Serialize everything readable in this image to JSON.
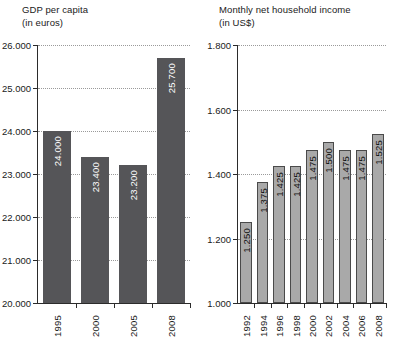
{
  "chart_data": [
    {
      "type": "bar",
      "id": "gdp-per-capita",
      "title": "GDP per capita",
      "subtitle": "(in euros)",
      "xlabel": "",
      "ylabel": "",
      "grid": true,
      "legend": "none",
      "categories": [
        "1995",
        "2000",
        "2005",
        "2008"
      ],
      "values": [
        24000,
        23400,
        23200,
        25700
      ],
      "value_labels": [
        "24.000",
        "23.400",
        "23.200",
        "25.700"
      ],
      "ylim": [
        20000,
        26000
      ],
      "yticks": [
        20000,
        21000,
        22000,
        23000,
        24000,
        25000,
        26000
      ],
      "ytick_labels": [
        "20.000",
        "21.000",
        "22.000",
        "23.000",
        "24.000",
        "25.000",
        "26.000"
      ],
      "bar_color": "#555558",
      "label_color": "#ffffff"
    },
    {
      "type": "bar",
      "id": "monthly-net-household-income",
      "title": "Monthly net household income",
      "subtitle": "(in US$)",
      "xlabel": "",
      "ylabel": "",
      "grid": true,
      "legend": "none",
      "categories": [
        "1992",
        "1994",
        "1996",
        "1998",
        "2000",
        "2002",
        "2004",
        "2006",
        "2008"
      ],
      "values": [
        1250,
        1375,
        1425,
        1425,
        1475,
        1500,
        1475,
        1475,
        1525
      ],
      "value_labels": [
        "1.250",
        "1.375",
        "1.425",
        "1.425",
        "1.475",
        "1.500",
        "1.475",
        "1.475",
        "1.525"
      ],
      "ylim": [
        1000,
        1800
      ],
      "yticks": [
        1000,
        1200,
        1400,
        1600,
        1800
      ],
      "ytick_labels": [
        "1.000",
        "1.200",
        "1.400",
        "1.600",
        "1.800"
      ],
      "bar_color": "#a9a9a9",
      "bar_border_color": "#4a4a4a",
      "label_color": "#111111"
    }
  ]
}
